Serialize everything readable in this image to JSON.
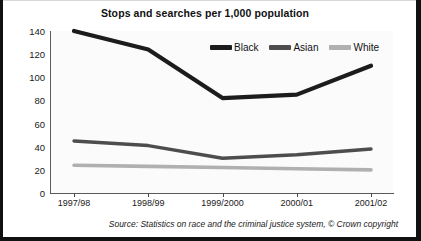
{
  "figure": {
    "title": "Stops and searches per 1,000 population",
    "clipped_top_text": "",
    "source_note": "Source: Statistics on race and the criminal justice system, © Crown copyright"
  },
  "legend": {
    "position": "inside-top-right",
    "entries": [
      {
        "label": "Black",
        "color": "#1c1c1c",
        "swatch_name": "legend-swatch-black"
      },
      {
        "label": "Asian",
        "color": "#4d4d4d",
        "swatch_name": "legend-swatch-asian"
      },
      {
        "label": "White",
        "color": "#b0b0b0",
        "swatch_name": "legend-swatch-white"
      }
    ]
  },
  "axes": {
    "y_ticks": [
      140,
      120,
      100,
      80,
      60,
      40,
      20,
      0
    ],
    "x_ticks": [
      "1997/98",
      "1998/99",
      "1999/2000",
      "2000/01",
      "2001/02"
    ],
    "ylim": [
      0,
      140
    ],
    "grid": false
  },
  "chart_data": {
    "type": "line",
    "title": "Stops and searches per 1,000 population",
    "xlabel": "",
    "ylabel": "",
    "ylim": [
      0,
      140
    ],
    "yticks": [
      0,
      20,
      40,
      60,
      80,
      100,
      120,
      140
    ],
    "grid": false,
    "legend_position": "inside-top-right",
    "categories": [
      "1997/98",
      "1998/99",
      "1999/2000",
      "2000/01",
      "2001/02"
    ],
    "series": [
      {
        "name": "Black",
        "color": "#1c1c1c",
        "values": [
          140,
          124,
          82,
          85,
          110
        ]
      },
      {
        "name": "Asian",
        "color": "#4d4d4d",
        "values": [
          45,
          41,
          30,
          33,
          38
        ]
      },
      {
        "name": "White",
        "color": "#b0b0b0",
        "values": [
          24,
          23,
          22,
          21,
          20
        ]
      }
    ],
    "source": "Source: Statistics on race and the criminal justice system, © Crown copyright"
  }
}
